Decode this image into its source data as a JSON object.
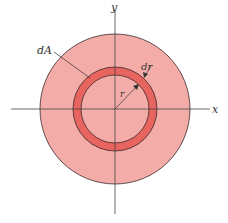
{
  "diagram": {
    "colors": {
      "outer_disk": "#f3aca8",
      "ring": "#e8645e",
      "stroke": "#3a2a2a",
      "axis": "#444444"
    },
    "labels": {
      "y_axis": "y",
      "x_axis": "x",
      "area_element": "dA",
      "ring_width": "dr",
      "radius": "r"
    }
  }
}
